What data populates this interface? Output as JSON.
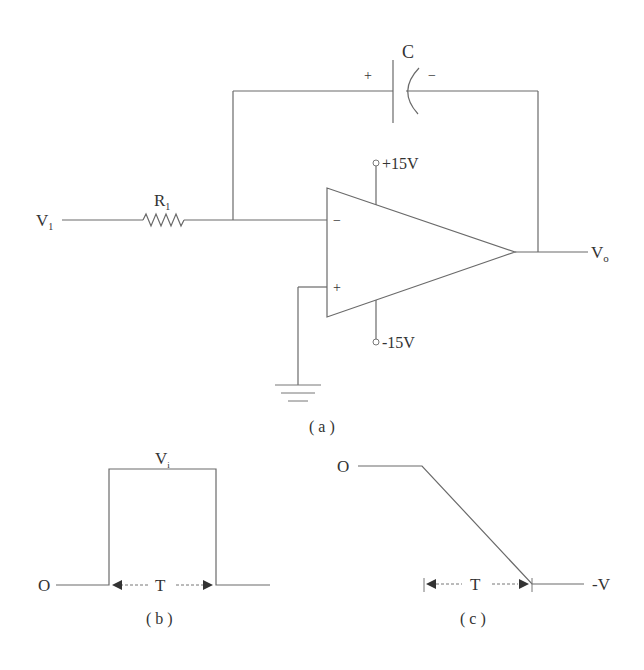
{
  "circuit": {
    "capacitor_label": "C",
    "cap_plus": "+",
    "cap_minus": "−",
    "resistor_label": "R",
    "resistor_subscript": "1",
    "input_label": "V",
    "input_subscript": "1",
    "output_label": "V",
    "output_subscript": "o",
    "vplus_supply": "+15V",
    "vminus_supply": "-15V",
    "inverting_sign": "−",
    "noninverting_sign": "+",
    "caption": "( a )"
  },
  "waveform_b": {
    "zero_label": "O",
    "level_label": "V",
    "level_subscript": "i",
    "period_label": "T",
    "caption": "( b )"
  },
  "waveform_c": {
    "zero_label": "O",
    "final_label": "-V",
    "period_label": "T",
    "caption": "( c )"
  }
}
